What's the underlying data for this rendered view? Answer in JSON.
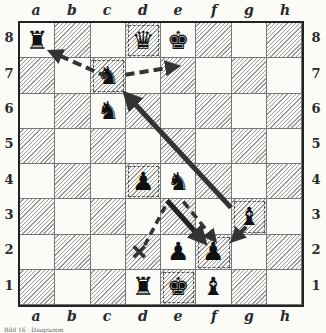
{
  "files": [
    "a",
    "b",
    "c",
    "d",
    "e",
    "f",
    "g",
    "h"
  ],
  "ranks": [
    "8",
    "7",
    "6",
    "5",
    "4",
    "3",
    "2",
    "1"
  ],
  "pieces": [
    {
      "square": "a8",
      "type": "rook",
      "color": "black",
      "glyph": "♜"
    },
    {
      "square": "d8",
      "type": "queen",
      "color": "black",
      "glyph": "♛",
      "highlight": true
    },
    {
      "square": "e8",
      "type": "king",
      "color": "black",
      "glyph": "♚"
    },
    {
      "square": "c7",
      "type": "knight",
      "color": "black",
      "glyph": "♞",
      "highlight": true
    },
    {
      "square": "c6",
      "type": "knight",
      "color": "black",
      "glyph": "♞"
    },
    {
      "square": "d4",
      "type": "pawn",
      "color": "black",
      "glyph": "♟",
      "highlight": true
    },
    {
      "square": "e4",
      "type": "knight",
      "color": "black",
      "glyph": "♞"
    },
    {
      "square": "g3",
      "type": "bishop",
      "color": "black",
      "glyph": "♝",
      "highlight": true
    },
    {
      "square": "e2",
      "type": "pawn",
      "color": "black",
      "glyph": "♟"
    },
    {
      "square": "f2",
      "type": "pawn",
      "color": "black",
      "glyph": "♟",
      "highlight": true
    },
    {
      "square": "d1",
      "type": "rook",
      "color": "black",
      "glyph": "♜"
    },
    {
      "square": "e1",
      "type": "king",
      "color": "black",
      "glyph": "♚",
      "highlight": true
    },
    {
      "square": "f1",
      "type": "bishop",
      "color": "black",
      "glyph": "♝"
    }
  ],
  "arrows": [
    {
      "from": "c7",
      "to": "a8",
      "style": "dashed"
    },
    {
      "from": "c7",
      "to": "e8",
      "style": "dashed"
    },
    {
      "from": "g3",
      "to": "c7",
      "style": "solid"
    },
    {
      "from": "e3",
      "to": "f2",
      "style": "solid"
    },
    {
      "from": "e4",
      "to": "f2",
      "style": "dashed"
    },
    {
      "from": "e4",
      "to": "d2",
      "style": "dashed",
      "end": "cross"
    },
    {
      "from": "g3",
      "to": "f2",
      "style": "solid-short"
    }
  ],
  "caption": "Bild 16 · Diagramm"
}
